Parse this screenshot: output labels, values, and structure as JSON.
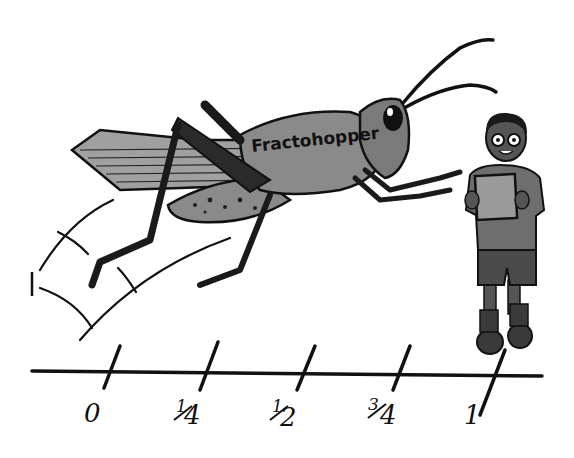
{
  "illustration": {
    "subject": "grasshopper jumping along a number line toward a student",
    "insect_label": "Fractohopper",
    "jump_mark_label": "1"
  },
  "number_line": {
    "ticks": [
      {
        "label": "0",
        "value": 0
      },
      {
        "label": "1/4",
        "numerator": "1",
        "denominator": "4",
        "value": 0.25
      },
      {
        "label": "1/2",
        "numerator": "1",
        "denominator": "2",
        "value": 0.5
      },
      {
        "label": "3/4",
        "numerator": "3",
        "denominator": "4",
        "value": 0.75
      },
      {
        "label": "1",
        "value": 1
      }
    ]
  },
  "colors": {
    "background": "#ffffff",
    "ink": "#111111",
    "body_gray": "#8a8a8a",
    "wing_gray": "#a0a0a0",
    "dark_gray": "#3a3a3a",
    "shirt_gray": "#6e6e6e",
    "shorts_gray": "#4a4a4a",
    "skin_gray": "#555555",
    "board_gray": "#9a9a9a"
  }
}
